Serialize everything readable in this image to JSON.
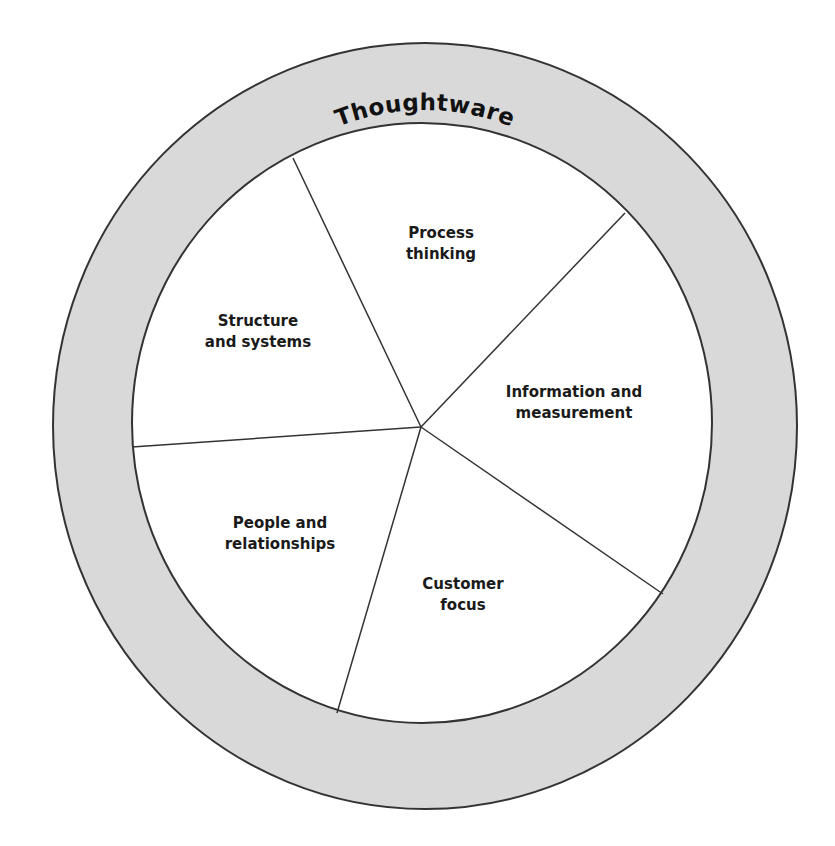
{
  "diagram": {
    "title": "Thoughtware",
    "colors": {
      "ring_fill": "#d9d9d9",
      "outline": "#333333",
      "inner_fill": "#ffffff",
      "text": "#1a1a1a"
    },
    "segments": [
      {
        "id": "process-thinking",
        "line1": "Process",
        "line2": "thinking"
      },
      {
        "id": "information-and-measurement",
        "line1": "Information and",
        "line2": "measurement"
      },
      {
        "id": "customer-focus",
        "line1": "Customer",
        "line2": "focus"
      },
      {
        "id": "people-and-relationships",
        "line1": "People and",
        "line2": "relationships"
      },
      {
        "id": "structure-and-systems",
        "line1": "Structure",
        "line2": "and systems"
      }
    ]
  }
}
